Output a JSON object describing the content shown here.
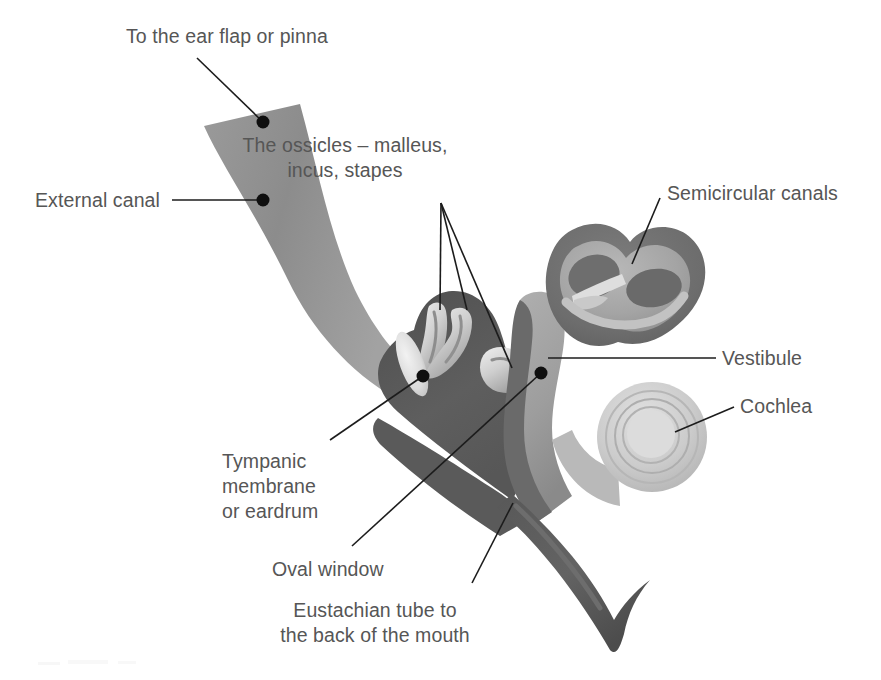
{
  "document": {
    "title": "Structure of the human ear",
    "type": "anatomical-diagram",
    "background_color": "#ffffff",
    "text_color": "#565656",
    "leader_line_color": "#1c1c1c"
  },
  "labels": [
    {
      "id": "ear-flap",
      "name": "to-the-ear-flap-or-pinna",
      "lines": [
        "To the ear flap or pinna"
      ],
      "align": "left",
      "x": 126,
      "y": 24
    },
    {
      "id": "external-canal",
      "name": "external-canal",
      "lines": [
        "External canal"
      ],
      "align": "left",
      "x": 35,
      "y": 188
    },
    {
      "id": "ossicles",
      "name": "the-ossicles-malleus-incus-stapes",
      "lines": [
        "The ossicles – malleus,",
        "incus, stapes"
      ],
      "align": "center",
      "x": 345,
      "y": 133
    },
    {
      "id": "semicircular-canals",
      "name": "semicircular-canals",
      "lines": [
        "Semicircular canals"
      ],
      "align": "left",
      "x": 667,
      "y": 181
    },
    {
      "id": "vestibule",
      "name": "vestibule",
      "lines": [
        "Vestibule"
      ],
      "align": "left",
      "x": 722,
      "y": 346
    },
    {
      "id": "cochlea",
      "name": "cochlea",
      "lines": [
        "Cochlea"
      ],
      "align": "left",
      "x": 740,
      "y": 394
    },
    {
      "id": "tympanic-membrane",
      "name": "tympanic-membrane-or-eardrum",
      "lines": [
        "Tympanic",
        "membrane",
        "or eardrum"
      ],
      "align": "left",
      "x": 222,
      "y": 449
    },
    {
      "id": "oval-window",
      "name": "oval-window",
      "lines": [
        "Oval window"
      ],
      "align": "left",
      "x": 272,
      "y": 557
    },
    {
      "id": "eustachian-tube",
      "name": "eustachian-tube-to-the-back-of-the-mouth",
      "lines": [
        "Eustachian tube to",
        "the back of the mouth"
      ],
      "align": "center",
      "x": 375,
      "y": 598
    }
  ],
  "leaders": [
    {
      "id": "ear-flap-leader",
      "name": "leader-line-ear-flap",
      "path": "M 197 58 L 263 122",
      "dot": [
        263,
        122
      ]
    },
    {
      "id": "external-canal-leader",
      "name": "leader-line-external-canal",
      "path": "M 172 200 L 263 200",
      "dot": [
        263,
        200
      ]
    },
    {
      "id": "ossicle-leader-1",
      "name": "leader-line-ossicle-malleus",
      "path": "M 441 203 L 440 310",
      "dot": null
    },
    {
      "id": "ossicle-leader-2",
      "name": "leader-line-ossicle-incus",
      "path": "M 441 203 L 467 310",
      "dot": null
    },
    {
      "id": "ossicle-leader-3",
      "name": "leader-line-ossicle-stapes",
      "path": "M 441 203 L 512 368",
      "dot": null
    },
    {
      "id": "semicircular-leader",
      "name": "leader-line-semicircular-canals",
      "path": "M 660 198 L 632 264",
      "dot": null
    },
    {
      "id": "vestibule-leader",
      "name": "leader-line-vestibule",
      "path": "M 716 358 L 548 358",
      "dot": null
    },
    {
      "id": "cochlea-leader",
      "name": "leader-line-cochlea",
      "path": "M 734 407 L 675 432",
      "dot": null
    },
    {
      "id": "tympanic-leader",
      "name": "leader-line-tympanic-membrane",
      "path": "M 330 440 L 423 376",
      "dot": [
        423,
        376
      ]
    },
    {
      "id": "oval-window-leader",
      "name": "leader-line-oval-window",
      "path": "M 352 546 L 541 373",
      "dot": [
        541,
        373
      ]
    },
    {
      "id": "eustachian-leader",
      "name": "leader-line-eustachian-tube",
      "path": "M 472 583 L 513 503",
      "dot": null
    }
  ],
  "anatomy": {
    "external_canal": {
      "name": "external-auditory-canal",
      "fill": "#8f8f8f"
    },
    "tympanic_membrane": {
      "name": "tympanic-membrane",
      "fill": "#e3e3e3"
    },
    "middle_ear_cavity": {
      "name": "middle-ear-cavity",
      "fill": "#5d5d5d"
    },
    "ossicles": {
      "name": "ossicles",
      "fill": "#d8d8d8"
    },
    "semicircular_canals": {
      "name": "semicircular-canals",
      "fill": "#9c9c9c",
      "outline": "#6b6b6b"
    },
    "vestibule": {
      "name": "vestibule",
      "fill": "#a8a8a8"
    },
    "cochlea": {
      "name": "cochlea",
      "fill": "#cfcfcf"
    },
    "eustachian_tube": {
      "name": "eustachian-tube",
      "fill": "#5d5d5d"
    }
  }
}
